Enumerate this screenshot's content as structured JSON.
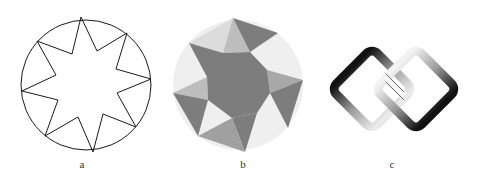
{
  "figures": [
    {
      "id": "a",
      "label": "a",
      "description": "line drawing of a circle with eight-pointed star inscribed"
    },
    {
      "id": "b",
      "label": "b",
      "description": "gray shaded faceted eight-pointed star in circle"
    },
    {
      "id": "c",
      "label": "c",
      "description": "two interlocked rounded diamond rings with metallic gradient"
    }
  ],
  "colors": {
    "line": "#1a1a1a",
    "dark": "#7a7a7a",
    "mid": "#9a9a9a",
    "light": "#c8c8c8",
    "pale": "#eeeeee"
  }
}
